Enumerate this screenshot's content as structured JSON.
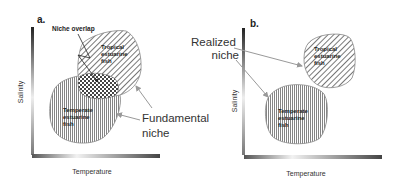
{
  "panels": [
    {
      "id": "a",
      "label": "a.",
      "x_axis_label": "Temperature",
      "y_axis_label": "Salinity",
      "regions": [
        {
          "name": "tropical",
          "lines": [
            "Tropical",
            "estuarine",
            "fish"
          ]
        },
        {
          "name": "temperate",
          "lines": [
            "Temperate",
            "estuarine",
            "fish"
          ]
        }
      ],
      "overlap_label": "Niche overlap",
      "callout_lines": [
        "Fundamental",
        "niche"
      ]
    },
    {
      "id": "b",
      "label": "b.",
      "x_axis_label": "Temperature",
      "y_axis_label": "Salinity",
      "regions": [
        {
          "name": "tropical",
          "lines": [
            "Tropical",
            "estuarine",
            "fish"
          ]
        },
        {
          "name": "temperate",
          "lines": [
            "Temperate",
            "estuarine",
            "fish"
          ]
        }
      ],
      "callout_lines": [
        "Realized",
        "niche"
      ]
    }
  ],
  "colors": {
    "axis_dark": "#333333",
    "axis_light": "#e8e8e8",
    "hatch_line": "#555555",
    "region_fill": "#ffffff",
    "arrow": "#999999",
    "text": "#333333"
  }
}
